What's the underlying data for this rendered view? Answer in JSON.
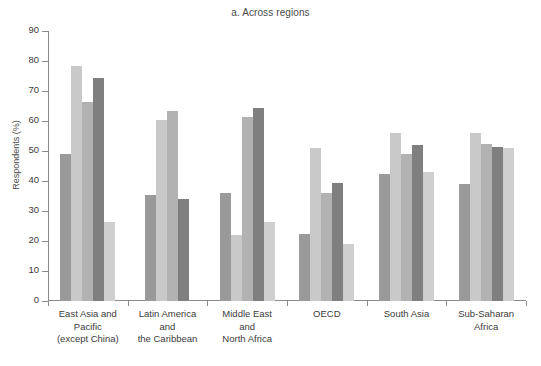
{
  "chart_data": {
    "type": "bar",
    "title": "a. Across regions",
    "xlabel": "",
    "ylabel": "Respondents (%)",
    "ylim": [
      0,
      90
    ],
    "ytick_step": 10,
    "yticks": [
      0,
      10,
      20,
      30,
      40,
      50,
      60,
      70,
      80,
      90
    ],
    "grid": false,
    "legend": "none",
    "categories": [
      "East Asia and\nPacific\n(except China)",
      "Latin America\nand\nthe Caribbean",
      "Middle East\nand\nNorth Africa",
      "OECD",
      "South Asia",
      "Sub-Saharan\nAfrica"
    ],
    "category_lines": [
      [
        "East Asia and",
        "Pacific",
        "(except China)"
      ],
      [
        "Latin America",
        "and",
        "the Caribbean"
      ],
      [
        "Middle East",
        "and",
        "North Africa"
      ],
      [
        "OECD"
      ],
      [
        "South Asia"
      ],
      [
        "Sub-Saharan",
        "Africa"
      ]
    ],
    "series": [
      {
        "name": "series-1",
        "color": "#9a9a9a",
        "values": [
          49.0,
          35.5,
          36.0,
          22.5,
          42.5,
          39.0
        ]
      },
      {
        "name": "series-2",
        "color": "#c9c9c9",
        "values": [
          78.5,
          60.5,
          22.0,
          51.0,
          56.0,
          56.0
        ]
      },
      {
        "name": "series-3",
        "color": "#b2b2b2",
        "values": [
          66.5,
          63.5,
          61.5,
          36.0,
          49.0,
          52.5
        ]
      },
      {
        "name": "series-4",
        "color": "#7f7f7f",
        "values": [
          74.5,
          34.0,
          64.5,
          39.5,
          52.0,
          51.5
        ]
      },
      {
        "name": "series-5",
        "color": "#cfcfcf",
        "values": [
          26.5,
          0.0,
          26.5,
          19.0,
          43.0,
          51.0
        ]
      }
    ]
  },
  "axis": {
    "y_label": "Respondents (%)"
  }
}
